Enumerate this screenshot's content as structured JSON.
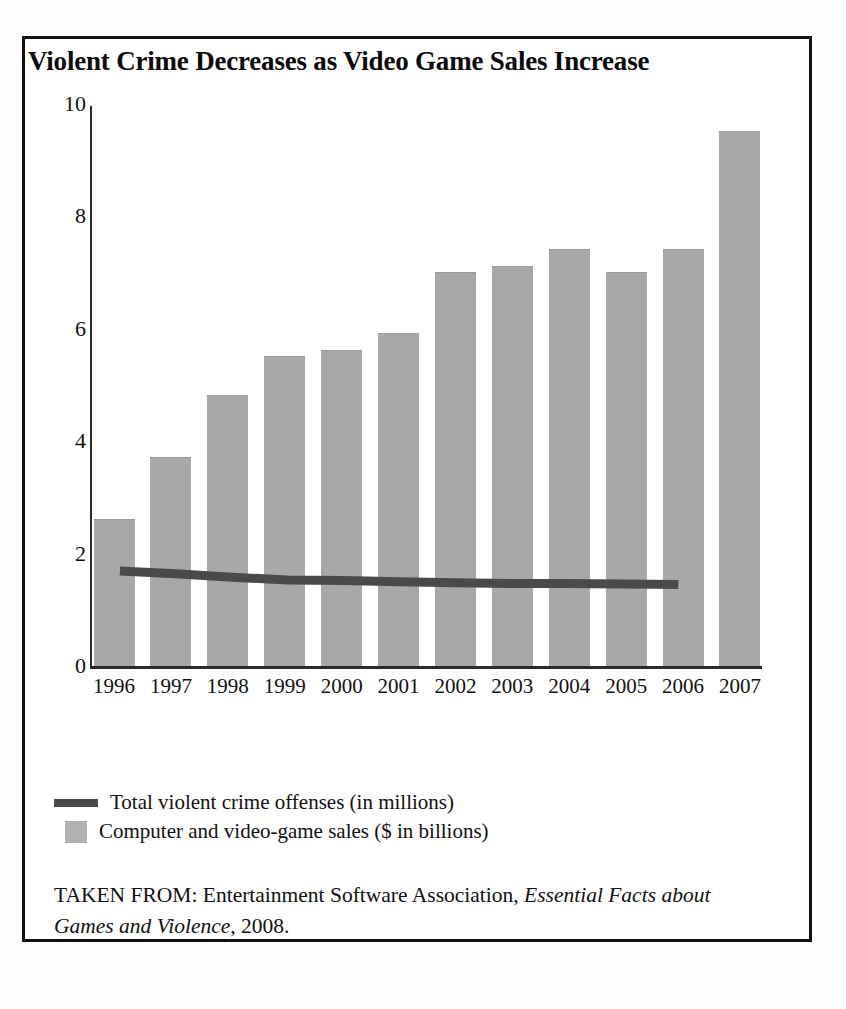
{
  "chart_data": {
    "type": "bar",
    "title": "Violent Crime Decreases as Video Game Sales Increase",
    "categories": [
      "1996",
      "1997",
      "1998",
      "1999",
      "2000",
      "2001",
      "2002",
      "2003",
      "2004",
      "2005",
      "2006",
      "2007"
    ],
    "xlabel": "",
    "ylabel": "",
    "ylim": [
      0,
      10
    ],
    "yticks": [
      10,
      8,
      6,
      4,
      2,
      0
    ],
    "grid": false,
    "legend_position": "below-plot",
    "series": [
      {
        "name": "Computer and video-game sales ($ in billions)",
        "type": "bar",
        "color": "#a8a8a8",
        "values": [
          2.6,
          3.7,
          4.8,
          5.5,
          5.6,
          5.9,
          7.0,
          7.1,
          7.4,
          7.0,
          7.4,
          9.5
        ]
      },
      {
        "name": "Total violent crime offenses (in millions)",
        "type": "line",
        "color": "#4a4a4a",
        "values": [
          1.69,
          1.64,
          1.58,
          1.53,
          1.52,
          1.5,
          1.48,
          1.47,
          1.47,
          1.46,
          1.45,
          null
        ]
      }
    ]
  },
  "legend": {
    "items": [
      {
        "label": "Total violent crime offenses (in millions)",
        "swatch": "line"
      },
      {
        "label": "Computer and video-game sales ($ in billions)",
        "swatch": "box"
      }
    ]
  },
  "source": {
    "prefix": "TAKEN FROM: Entertainment Software Association, ",
    "italic": "Essential Facts about Games and Violence",
    "suffix": ", 2008."
  }
}
